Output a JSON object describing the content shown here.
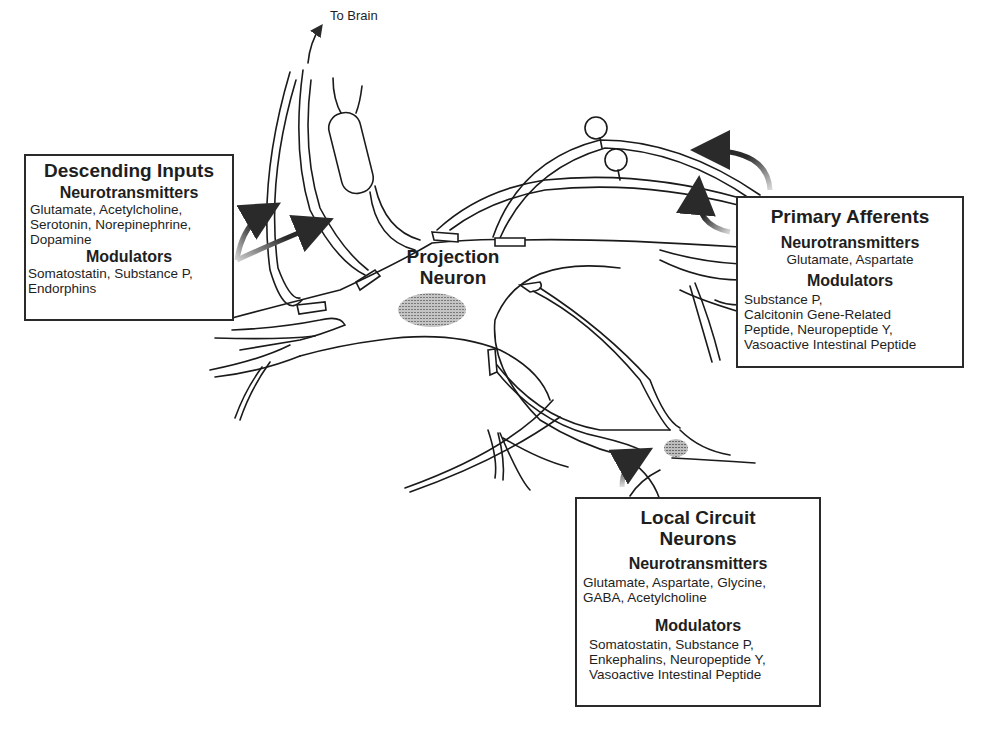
{
  "diagram": {
    "to_brain_label": "To Brain",
    "projection_neuron": {
      "line1": "Projection",
      "line2": "Neuron"
    },
    "descending_inputs": {
      "title": "Descending Inputs",
      "neurotransmitters_heading": "Neurotransmitters",
      "neurotransmitters": [
        "Glutamate, Acetylcholine,",
        "Serotonin, Norepinephrine,",
        "Dopamine"
      ],
      "modulators_heading": "Modulators",
      "modulators": [
        "Somatostatin, Substance P,",
        "Endorphins"
      ]
    },
    "primary_afferents": {
      "title": "Primary Afferents",
      "neurotransmitters_heading": "Neurotransmitters",
      "neurotransmitters": [
        "Glutamate, Aspartate"
      ],
      "modulators_heading": "Modulators",
      "modulators": [
        "Substance P,",
        "Calcitonin Gene-Related",
        "Peptide, Neuropeptide Y,",
        "Vasoactive Intestinal Peptide"
      ]
    },
    "local_circuit_neurons": {
      "title_line1": "Local Circuit",
      "title_line2": "Neurons",
      "neurotransmitters_heading": "Neurotransmitters",
      "neurotransmitters": [
        "Glutamate, Aspartate, Glycine,",
        "GABA, Acetylcholine"
      ],
      "modulators_heading": "Modulators",
      "modulators": [
        "Somatostatin, Substance P,",
        "Enkephalins, Neuropeptide Y,",
        "Vasoactive Intestinal Peptide"
      ]
    },
    "colors": {
      "line": "#1a1a1a",
      "nucleus": "#8a8a8a",
      "arrow": "#2a2a2a"
    }
  }
}
